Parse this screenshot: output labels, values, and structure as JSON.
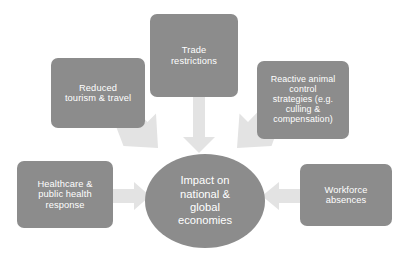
{
  "diagram": {
    "type": "hub-and-spoke",
    "title": "Impact on national & global economies",
    "colors": {
      "node_fill": "#8c8c8c",
      "node_text": "#ffffff",
      "arrow_fill": "#e3e3e3",
      "background": "#ffffff"
    },
    "hub": {
      "id": "impact",
      "label": "Impact on\nnational &\nglobal\neconomies",
      "shape": "ellipse"
    },
    "nodes": [
      {
        "id": "trade",
        "label": "Trade\nrestrictions",
        "position": "top-center",
        "arrow": "down"
      },
      {
        "id": "tourism",
        "label": "Reduced\ntourism & travel",
        "position": "top-left",
        "arrow": "down-right"
      },
      {
        "id": "reactive",
        "label": "Reactive animal\ncontrol\nstrategies (e.g.\nculling &\ncompensation)",
        "position": "top-right",
        "arrow": "down-left"
      },
      {
        "id": "healthcare",
        "label": "Healthcare &\npublic health\nresponse",
        "position": "left",
        "arrow": "right"
      },
      {
        "id": "workforce",
        "label": "Workforce\nabsences",
        "position": "right",
        "arrow": "left"
      }
    ],
    "arrows": [
      {
        "id": "arrow-tourism-to-hub",
        "from": "tourism",
        "to": "impact",
        "direction": "down-right"
      },
      {
        "id": "arrow-trade-to-hub",
        "from": "trade",
        "to": "impact",
        "direction": "down"
      },
      {
        "id": "arrow-reactive-to-hub",
        "from": "reactive",
        "to": "impact",
        "direction": "down-left"
      },
      {
        "id": "arrow-healthcare-to-hub",
        "from": "healthcare",
        "to": "impact",
        "direction": "right"
      },
      {
        "id": "arrow-workforce-to-hub",
        "from": "workforce",
        "to": "impact",
        "direction": "left"
      }
    ]
  }
}
